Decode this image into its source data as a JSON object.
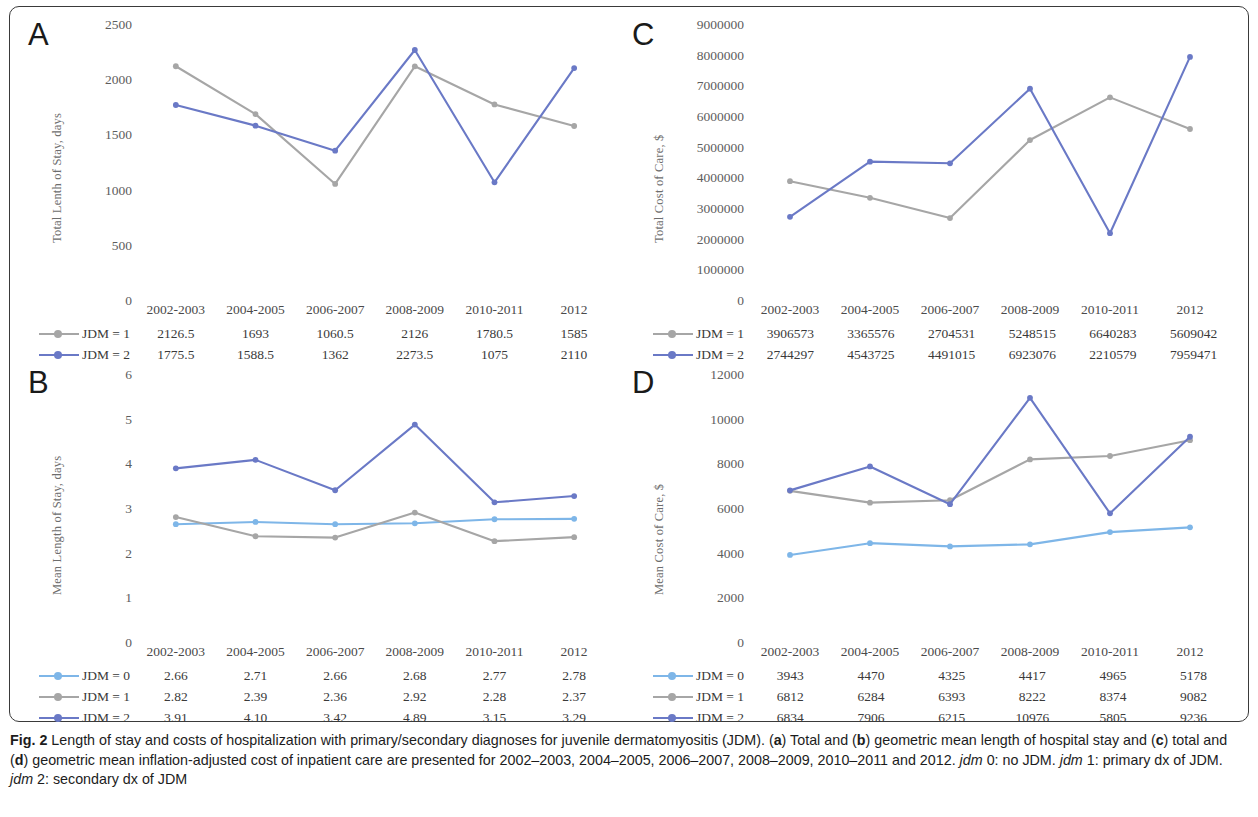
{
  "figure": {
    "label": "Fig. 2",
    "caption_parts": [
      {
        "t": "Length of stay and costs of hospitalization with primary/secondary diagnoses for juvenile dermatomyositis (JDM). ("
      },
      {
        "t": "a",
        "s": "b"
      },
      {
        "t": ") Total and ("
      },
      {
        "t": "b",
        "s": "b"
      },
      {
        "t": ") geometric mean length of hospital stay and ("
      },
      {
        "t": "c",
        "s": "b"
      },
      {
        "t": ") total and ("
      },
      {
        "t": "d",
        "s": "b"
      },
      {
        "t": ") geometric mean inflation-adjusted cost of inpatient care are presented for 2002–2003, 2004–2005, 2006–2007, 2008–2009, 2010–2011 and 2012. "
      },
      {
        "t": "jdm",
        "s": "i"
      },
      {
        "t": " 0: no JDM. "
      },
      {
        "t": "jdm",
        "s": "i"
      },
      {
        "t": " 1: primary dx of JDM. "
      },
      {
        "t": "jdm",
        "s": "i"
      },
      {
        "t": " 2: secondary dx of JDM"
      }
    ]
  },
  "colors": {
    "jdm0": "#7eb6e8",
    "jdm1": "#a6a6a6",
    "jdm2": "#6a79c6",
    "axis_text": "#5d5d5d"
  },
  "categories": [
    "2002-2003",
    "2004-2005",
    "2006-2007",
    "2008-2009",
    "2010-2011",
    "2012"
  ],
  "series_labels": {
    "jdm0": "JDM = 0",
    "jdm1": "JDM = 1",
    "jdm2": "JDM = 2"
  },
  "panels": {
    "A": {
      "letter": "A",
      "ylabel": "Total Lenth of Stay, days",
      "yticks": [
        "2500",
        "2000",
        "1500",
        "1000",
        "500",
        "0"
      ]
    },
    "B": {
      "letter": "B",
      "ylabel": "Mean Length of Stay, days",
      "yticks": [
        "6",
        "5",
        "4",
        "3",
        "2",
        "1",
        "0"
      ]
    },
    "C": {
      "letter": "C",
      "ylabel": "Total Cost of Care, $",
      "yticks": [
        "9000000",
        "8000000",
        "7000000",
        "6000000",
        "5000000",
        "4000000",
        "3000000",
        "2000000",
        "1000000",
        "0"
      ]
    },
    "D": {
      "letter": "D",
      "ylabel": "Mean Cost of Care, $",
      "yticks": [
        "12000",
        "10000",
        "8000",
        "6000",
        "4000",
        "2000",
        "0"
      ]
    }
  },
  "chart_data": [
    {
      "panel": "A",
      "type": "line",
      "title": "Total Length of Stay",
      "xlabel": "",
      "ylabel": "Total Lenth of Stay, days",
      "categories": [
        "2002-2003",
        "2004-2005",
        "2006-2007",
        "2008-2009",
        "2010-2011",
        "2012"
      ],
      "ylim": [
        0,
        2500
      ],
      "yticks": [
        0,
        500,
        1000,
        1500,
        2000,
        2500
      ],
      "grid": false,
      "legend": "below-table",
      "series": [
        {
          "name": "JDM = 1",
          "color": "#a6a6a6",
          "values": [
            2126.5,
            1693,
            1060.5,
            2126,
            1780.5,
            1585
          ],
          "labels": [
            "2126.5",
            "1693",
            "1060.5",
            "2126",
            "1780.5",
            "1585"
          ]
        },
        {
          "name": "JDM = 2",
          "color": "#6a79c6",
          "values": [
            1775.5,
            1588.5,
            1362,
            2273.5,
            1075,
            2110
          ],
          "labels": [
            "1775.5",
            "1588.5",
            "1362",
            "2273.5",
            "1075",
            "2110"
          ]
        }
      ]
    },
    {
      "panel": "B",
      "type": "line",
      "title": "Mean Length of Stay",
      "xlabel": "",
      "ylabel": "Mean Length of Stay, days",
      "categories": [
        "2002-2003",
        "2004-2005",
        "2006-2007",
        "2008-2009",
        "2010-2011",
        "2012"
      ],
      "ylim": [
        0,
        6
      ],
      "yticks": [
        0,
        1,
        2,
        3,
        4,
        5,
        6
      ],
      "grid": false,
      "legend": "below-table",
      "series": [
        {
          "name": "JDM = 0",
          "color": "#7eb6e8",
          "values": [
            2.66,
            2.71,
            2.66,
            2.68,
            2.77,
            2.78
          ],
          "labels": [
            "2.66",
            "2.71",
            "2.66",
            "2.68",
            "2.77",
            "2.78"
          ]
        },
        {
          "name": "JDM = 1",
          "color": "#a6a6a6",
          "values": [
            2.82,
            2.39,
            2.36,
            2.92,
            2.28,
            2.37
          ],
          "labels": [
            "2.82",
            "2.39",
            "2.36",
            "2.92",
            "2.28",
            "2.37"
          ]
        },
        {
          "name": "JDM = 2",
          "color": "#6a79c6",
          "values": [
            3.91,
            4.1,
            3.42,
            4.89,
            3.15,
            3.29
          ],
          "labels": [
            "3.91",
            "4.10",
            "3.42",
            "4.89",
            "3.15",
            "3.29"
          ]
        }
      ]
    },
    {
      "panel": "C",
      "type": "line",
      "title": "Total Cost of Care",
      "xlabel": "",
      "ylabel": "Total Cost of Care, $",
      "categories": [
        "2002-2003",
        "2004-2005",
        "2006-2007",
        "2008-2009",
        "2010-2011",
        "2012"
      ],
      "ylim": [
        0,
        9000000
      ],
      "yticks": [
        0,
        1000000,
        2000000,
        3000000,
        4000000,
        5000000,
        6000000,
        7000000,
        8000000,
        9000000
      ],
      "grid": false,
      "legend": "below-table",
      "series": [
        {
          "name": "JDM = 1",
          "color": "#a6a6a6",
          "values": [
            3906573,
            3365576,
            2704531,
            5248515,
            6640283,
            5609042
          ],
          "labels": [
            "3906573",
            "3365576",
            "2704531",
            "5248515",
            "6640283",
            "5609042"
          ]
        },
        {
          "name": "JDM = 2",
          "color": "#6a79c6",
          "values": [
            2744297,
            4543725,
            4491015,
            6923076,
            2210579,
            7959471
          ],
          "labels": [
            "2744297",
            "4543725",
            "4491015",
            "6923076",
            "2210579",
            "7959471"
          ]
        }
      ]
    },
    {
      "panel": "D",
      "type": "line",
      "title": "Mean Cost of Care",
      "xlabel": "",
      "ylabel": "Mean Cost of Care, $",
      "categories": [
        "2002-2003",
        "2004-2005",
        "2006-2007",
        "2008-2009",
        "2010-2011",
        "2012"
      ],
      "ylim": [
        0,
        12000
      ],
      "yticks": [
        0,
        2000,
        4000,
        6000,
        8000,
        10000,
        12000
      ],
      "grid": false,
      "legend": "below-table",
      "series": [
        {
          "name": "JDM = 0",
          "color": "#7eb6e8",
          "values": [
            3943,
            4470,
            4325,
            4417,
            4965,
            5178
          ],
          "labels": [
            "3943",
            "4470",
            "4325",
            "4417",
            "4965",
            "5178"
          ]
        },
        {
          "name": "JDM = 1",
          "color": "#a6a6a6",
          "values": [
            6812,
            6284,
            6393,
            8222,
            8374,
            9082
          ],
          "labels": [
            "6812",
            "6284",
            "6393",
            "8222",
            "8374",
            "9082"
          ]
        },
        {
          "name": "JDM = 2",
          "color": "#6a79c6",
          "values": [
            6834,
            7906,
            6215,
            10976,
            5805,
            9236
          ],
          "labels": [
            "6834",
            "7906",
            "6215",
            "10976",
            "5805",
            "9236"
          ]
        }
      ]
    }
  ]
}
